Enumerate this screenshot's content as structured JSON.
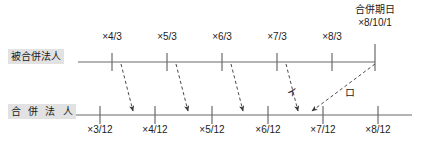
{
  "diagram": {
    "title_note": "合併期日",
    "merge_date_value": "×8/10/1",
    "upper_row": {
      "label": "被合併法人",
      "ticks": [
        {
          "label": "×4/3",
          "x": 112
        },
        {
          "label": "×5/3",
          "x": 167
        },
        {
          "label": "×6/3",
          "x": 222
        },
        {
          "label": "×7/3",
          "x": 277
        },
        {
          "label": "×8/3",
          "x": 332
        }
      ],
      "line_start_x": 78,
      "line_end_x": 375,
      "line_y": 62
    },
    "lower_row": {
      "label": "合 併 法 人",
      "ticks": [
        {
          "label": "×3/12",
          "x": 100
        },
        {
          "label": "×4/12",
          "x": 155
        },
        {
          "label": "×5/12",
          "x": 212
        },
        {
          "label": "×6/12",
          "x": 268
        },
        {
          "label": "×7/12",
          "x": 323
        },
        {
          "label": "×8/12",
          "x": 378
        }
      ],
      "line_start_x": 62,
      "line_end_x": 412,
      "line_y": 115
    },
    "annotations": [
      {
        "label": "イ",
        "x": 292,
        "y": 84
      },
      {
        "label": "ロ",
        "x": 350,
        "y": 84
      }
    ],
    "arrows": [
      {
        "from_x": 121,
        "to_x": 133
      },
      {
        "from_x": 176,
        "to_x": 188
      },
      {
        "from_x": 231,
        "to_x": 243
      },
      {
        "from_x": 286,
        "to_x": 298
      },
      {
        "from_x": 375,
        "to_x": 312
      }
    ],
    "colors": {
      "line": "#6b6b6b",
      "text": "#1b1b1b",
      "label_bg": "#e2e2e2",
      "background": "#ffffff"
    }
  }
}
